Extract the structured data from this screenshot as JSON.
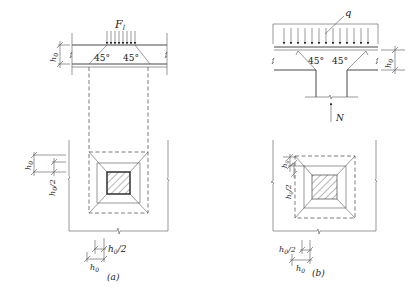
{
  "figure_a": {
    "caption": "(a)",
    "load_label": "F",
    "load_subscript": "l",
    "angle_left": "45°",
    "angle_right": "45°",
    "thickness_label": "h0",
    "plan_dim_outer": "h0",
    "plan_dim_inner": "h0/2",
    "bottom_dim_inner": "h0/2",
    "bottom_dim_outer": "h0"
  },
  "figure_b": {
    "caption": "(b)",
    "load_label": "q",
    "axial_label": "N",
    "angle_left": "45°",
    "angle_right": "45°",
    "thickness_label": "h0",
    "plan_dim_outer": "h0",
    "plan_dim_inner": "h0/2",
    "bottom_dim_inner": "h0/2",
    "bottom_dim_outer": "h0"
  }
}
